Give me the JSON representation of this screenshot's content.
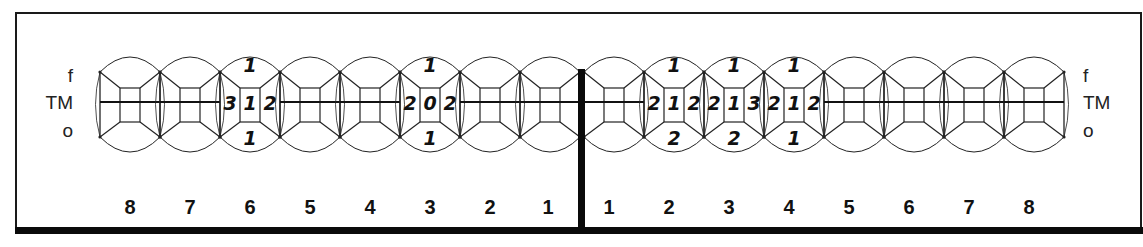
{
  "chart_title": "",
  "side_labels": {
    "left": {
      "top": "f",
      "middle": "TM",
      "bottom": "o"
    },
    "right": {
      "top": "f",
      "middle": "TM",
      "bottom": "o"
    }
  },
  "quadrants": {
    "left": {
      "teeth": [
        {
          "number": "8",
          "x": 100,
          "annotations": null
        },
        {
          "number": "7",
          "x": 160,
          "annotations": null
        },
        {
          "number": "6",
          "x": 220,
          "annotations": {
            "top": "1",
            "left": "3",
            "center": "1",
            "right": "2",
            "bottom": "1"
          }
        },
        {
          "number": "5",
          "x": 280,
          "annotations": null
        },
        {
          "number": "4",
          "x": 340,
          "annotations": null
        },
        {
          "number": "3",
          "x": 400,
          "annotations": {
            "top": "1",
            "left": "2",
            "center": "0",
            "right": "2",
            "bottom": "1"
          }
        },
        {
          "number": "2",
          "x": 460,
          "annotations": null
        },
        {
          "number": "1",
          "x": 520,
          "annotations": null
        }
      ]
    },
    "right": {
      "teeth": [
        {
          "number": "1",
          "x": 584,
          "annotations": null
        },
        {
          "number": "2",
          "x": 644,
          "annotations": {
            "top": "1",
            "left": "2",
            "center": "1",
            "right": "2",
            "bottom": "2"
          }
        },
        {
          "number": "3",
          "x": 704,
          "annotations": {
            "top": "1",
            "left": "2",
            "center": "1",
            "right": "3",
            "bottom": "2"
          }
        },
        {
          "number": "4",
          "x": 764,
          "annotations": {
            "top": "1",
            "left": "2",
            "center": "1",
            "right": "2",
            "bottom": "1"
          }
        },
        {
          "number": "5",
          "x": 824,
          "annotations": null
        },
        {
          "number": "6",
          "x": 884,
          "annotations": null
        },
        {
          "number": "7",
          "x": 944,
          "annotations": null
        },
        {
          "number": "8",
          "x": 1004,
          "annotations": null
        }
      ]
    }
  },
  "labels": {
    "left_numbers": [
      "8",
      "7",
      "6",
      "5",
      "4",
      "3",
      "2",
      "1"
    ],
    "right_numbers": [
      "1",
      "2",
      "3",
      "4",
      "5",
      "6",
      "7",
      "8"
    ]
  },
  "colors": {
    "line": "#222222",
    "thick_line": "#0a0a0a",
    "background": "#ffffff",
    "text": "#111111"
  }
}
